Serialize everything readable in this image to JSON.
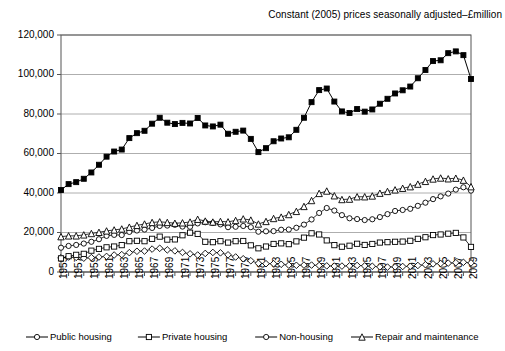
{
  "chart_data": {
    "type": "line",
    "title": "Constant (2005) prices seasonally adjusted–£million",
    "xlabel": "",
    "ylabel": "",
    "grid": true,
    "legend_position": "bottom",
    "xlim": [
      1955,
      2009
    ],
    "ylim": [
      0,
      120000
    ],
    "yticks": [
      0,
      20000,
      40000,
      60000,
      80000,
      100000,
      120000
    ],
    "ytick_labels": [
      "0",
      "20,000",
      "40,000",
      "60,000",
      "80,000",
      "100,000",
      "120,000"
    ],
    "x": [
      1955,
      1956,
      1957,
      1958,
      1959,
      1960,
      1961,
      1962,
      1963,
      1964,
      1965,
      1966,
      1967,
      1968,
      1969,
      1970,
      1971,
      1972,
      1973,
      1974,
      1975,
      1976,
      1977,
      1978,
      1979,
      1980,
      1981,
      1982,
      1983,
      1984,
      1985,
      1986,
      1987,
      1988,
      1989,
      1990,
      1991,
      1992,
      1993,
      1994,
      1995,
      1996,
      1997,
      1998,
      1999,
      2000,
      2001,
      2002,
      2003,
      2004,
      2005,
      2006,
      2007,
      2008,
      2009
    ],
    "xtick_labels": [
      "1955",
      "1957",
      "1959",
      "1961",
      "1963",
      "1965",
      "1967",
      "1969",
      "1971",
      "1973",
      "1975",
      "1977",
      "1979",
      "1981",
      "1983",
      "1985",
      "1987",
      "1989",
      "1991",
      "1993",
      "1995",
      "1997",
      "1999",
      "2001",
      "2003",
      "2005",
      "2007",
      "2009"
    ],
    "series": [
      {
        "name": "Public housing",
        "marker": "diamond",
        "filled": false,
        "values": [
          7200,
          7600,
          7400,
          7000,
          7300,
          7600,
          7900,
          8600,
          8800,
          9800,
          10500,
          10600,
          11600,
          12000,
          11200,
          10700,
          9900,
          9200,
          8600,
          9400,
          9900,
          9700,
          8700,
          7600,
          6700,
          5700,
          4400,
          4200,
          4200,
          3900,
          3500,
          3400,
          3500,
          3500,
          3300,
          3100,
          3000,
          3000,
          3100,
          3300,
          3100,
          2900,
          2600,
          2500,
          2600,
          2800,
          2900,
          3300,
          3700,
          4100,
          4300,
          4500,
          4700,
          4900,
          4600
        ]
      },
      {
        "name": "Private housing",
        "marker": "square",
        "filled": false,
        "values": [
          6900,
          8000,
          8700,
          9200,
          10800,
          11700,
          12500,
          12900,
          13600,
          15600,
          15800,
          15600,
          16800,
          17900,
          16400,
          16500,
          18600,
          19900,
          19300,
          15300,
          15100,
          15600,
          14900,
          15600,
          15700,
          13500,
          12000,
          12900,
          14200,
          14500,
          14100,
          15500,
          17400,
          19600,
          19000,
          16000,
          13600,
          12800,
          13300,
          14300,
          13700,
          14200,
          14900,
          15100,
          15300,
          15400,
          15800,
          16800,
          17600,
          18700,
          19000,
          19400,
          19800,
          17500,
          12700
        ]
      },
      {
        "name": "Non-housing",
        "marker": "circle",
        "filled": false,
        "values": [
          12300,
          13200,
          13700,
          14400,
          15300,
          16600,
          18300,
          18800,
          18700,
          20300,
          21000,
          21500,
          22300,
          23300,
          23500,
          23900,
          23000,
          22900,
          24600,
          25200,
          24800,
          24100,
          22700,
          22900,
          23300,
          22700,
          20400,
          20600,
          20700,
          21400,
          21500,
          22400,
          24000,
          26600,
          29900,
          32400,
          31100,
          28800,
          27200,
          26800,
          26300,
          26700,
          27800,
          29300,
          30900,
          31400,
          32000,
          33500,
          35100,
          36900,
          38300,
          39700,
          41700,
          42900,
          41200
        ]
      },
      {
        "name": "Repair and maintenance",
        "marker": "triangle",
        "filled": false,
        "values": [
          17900,
          18300,
          18300,
          18800,
          19500,
          20100,
          20800,
          21300,
          21800,
          22700,
          23600,
          24300,
          25100,
          25400,
          25100,
          24700,
          24900,
          25300,
          26700,
          25800,
          25300,
          25600,
          25400,
          26100,
          26900,
          26300,
          24300,
          25600,
          27100,
          27800,
          29100,
          30700,
          33200,
          36200,
          39800,
          41000,
          38600,
          36700,
          36900,
          38100,
          38100,
          38500,
          39900,
          40800,
          41600,
          42400,
          43200,
          44500,
          45900,
          47100,
          47600,
          47200,
          47500,
          46500,
          43200
        ]
      },
      {
        "name": "Total all work",
        "marker": "square",
        "filled": true,
        "values": [
          41500,
          44500,
          45500,
          47200,
          50400,
          54300,
          58400,
          61000,
          62000,
          67800,
          70300,
          71500,
          75100,
          78100,
          75600,
          74900,
          75500,
          75200,
          78000,
          74200,
          73700,
          74600,
          70000,
          71000,
          71600,
          67400,
          60700,
          62700,
          66200,
          67600,
          68200,
          72000,
          78100,
          86000,
          92100,
          92900,
          86300,
          81300,
          80500,
          82500,
          81200,
          82300,
          85200,
          87700,
          90400,
          92000,
          93900,
          98100,
          102300,
          106800,
          107200,
          110800,
          111700,
          109800,
          97700
        ]
      }
    ]
  },
  "legend": {
    "items": [
      {
        "label": "Public housing",
        "marker": "circle-open"
      },
      {
        "label": "Private housing",
        "marker": "square-open"
      },
      {
        "label": "Non-housing",
        "marker": "circle-open"
      },
      {
        "label": "Repair and maintenance",
        "marker": "triangle-open"
      },
      {
        "label": "Total all work",
        "marker": "square-filled"
      }
    ]
  }
}
